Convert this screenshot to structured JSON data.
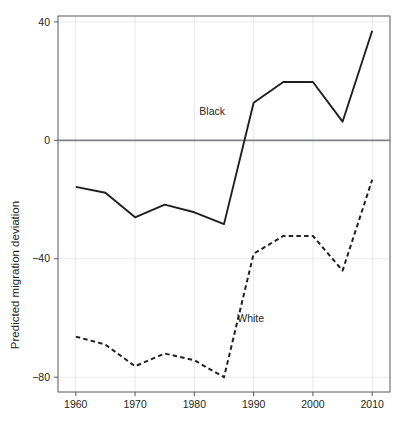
{
  "chart_data": {
    "type": "line",
    "title": "",
    "xlabel": "",
    "ylabel": "Predicted migration deviation",
    "x": [
      1960,
      1965,
      1970,
      1975,
      1980,
      1985,
      1990,
      1995,
      2000,
      2005,
      2010
    ],
    "xlim": [
      1957,
      2013
    ],
    "ylim": [
      -85,
      42
    ],
    "xticks": [
      1960,
      1970,
      1980,
      1990,
      2000,
      2010
    ],
    "xtick_labels": [
      "1960",
      "1970",
      "1980",
      "1990",
      "2000",
      "2010"
    ],
    "yticks": [
      40,
      0,
      -40,
      -80
    ],
    "ytick_labels": [
      "40",
      "0",
      "−40",
      "−80"
    ],
    "grid": true,
    "grid_color": "#e8e8ea",
    "zero_line": 0,
    "zero_line_color": "#808285",
    "legend_position": "inline-annotations",
    "series": [
      {
        "name": "Black",
        "style": "solid",
        "color": "#231f20",
        "label_annotation": "Black",
        "values": [
          -15.7,
          -17.7,
          -26.0,
          -21.7,
          -24.3,
          -28.3,
          12.7,
          19.7,
          19.7,
          6.3,
          37.0
        ]
      },
      {
        "name": "White",
        "style": "dashed",
        "color": "#231f20",
        "label_annotation": "White",
        "values": [
          -66.3,
          -69.0,
          -76.3,
          -72.0,
          -74.3,
          -80.0,
          -38.3,
          -32.3,
          -32.3,
          -44.0,
          -13.3
        ]
      }
    ],
    "annotations": [
      {
        "text": "Black",
        "x": 1983.0,
        "y": 8.5
      },
      {
        "text": "White",
        "x": 1989.5,
        "y": -61.5
      }
    ]
  }
}
